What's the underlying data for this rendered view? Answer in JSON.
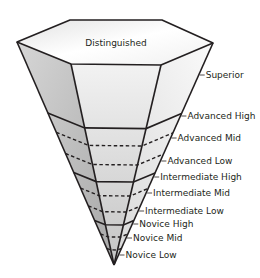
{
  "diagram": {
    "top_label": "Distinguished",
    "levels": [
      {
        "name": "Superior",
        "major": "Superior"
      },
      {
        "name": "Advanced High",
        "major": "Advanced"
      },
      {
        "name": "Advanced Mid",
        "major": "Advanced"
      },
      {
        "name": "Advanced Low",
        "major": "Advanced"
      },
      {
        "name": "Intermediate High",
        "major": "Intermediate"
      },
      {
        "name": "Intermediate Mid",
        "major": "Intermediate"
      },
      {
        "name": "Intermediate Low",
        "major": "Intermediate"
      },
      {
        "name": "Novice High",
        "major": "Novice"
      },
      {
        "name": "Novice Mid",
        "major": "Novice"
      },
      {
        "name": "Novice Low",
        "major": "Novice"
      }
    ],
    "colors": {
      "outline": "#231f20",
      "top_face": "#f4f4f4",
      "left_face": "#b9b9b9",
      "front_face": "#dcdcdc",
      "right_face": "#ececec"
    }
  }
}
